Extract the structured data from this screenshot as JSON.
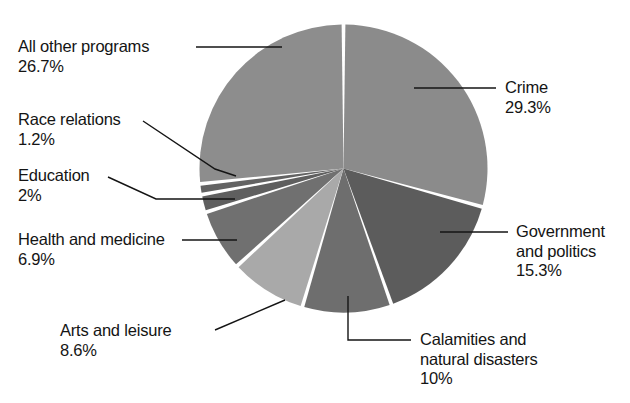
{
  "chart_data": {
    "type": "pie",
    "title": "",
    "subtitle": "",
    "xlabel": "",
    "ylabel": "",
    "grid": false,
    "legend_position": "none",
    "start_angle_deg": 0,
    "direction": "clockwise",
    "separator_color": "#ffffff",
    "background": "#ffffff",
    "text_color": "#141414",
    "categories": [
      "Crime",
      "Government and politics",
      "Calamities and natural disasters",
      "Arts and leisure",
      "Health and medicine",
      "Education",
      "Race relations",
      "All other programs"
    ],
    "values": [
      29.3,
      15.3,
      10,
      8.6,
      6.9,
      2,
      1.2,
      26.7
    ],
    "value_labels": [
      "29.3%",
      "15.3%",
      "10%",
      "8.6%",
      "6.9%",
      "2%",
      "1.2%",
      "26.7%"
    ],
    "colors": [
      "#8b8b8b",
      "#5c5c5c",
      "#6e6e6e",
      "#a9a9a9",
      "#707070",
      "#5f5f5f",
      "#636363",
      "#8d8d8d"
    ],
    "slices": [
      {
        "name": "Crime",
        "label_line1": "Crime",
        "label_line2": "",
        "percent_label": "29.3%",
        "value": 29.3,
        "color": "#8b8b8b"
      },
      {
        "name": "Government and politics",
        "label_line1": "Government",
        "label_line2": "and politics",
        "percent_label": "15.3%",
        "value": 15.3,
        "color": "#5c5c5c"
      },
      {
        "name": "Calamities and natural disasters",
        "label_line1": "Calamities and",
        "label_line2": "natural disasters",
        "percent_label": "10%",
        "value": 10,
        "color": "#6e6e6e"
      },
      {
        "name": "Arts and leisure",
        "label_line1": "Arts and leisure",
        "label_line2": "",
        "percent_label": "8.6%",
        "value": 8.6,
        "color": "#a9a9a9"
      },
      {
        "name": "Health and medicine",
        "label_line1": "Health and medicine",
        "label_line2": "",
        "percent_label": "6.9%",
        "value": 6.9,
        "color": "#707070"
      },
      {
        "name": "Education",
        "label_line1": "Education",
        "label_line2": "",
        "percent_label": "2%",
        "value": 2,
        "color": "#5f5f5f"
      },
      {
        "name": "Race relations",
        "label_line1": "Race relations",
        "label_line2": "",
        "percent_label": "1.2%",
        "value": 1.2,
        "color": "#636363"
      },
      {
        "name": "All other programs",
        "label_line1": "All other programs",
        "label_line2": "",
        "percent_label": "26.7%",
        "value": 26.7,
        "color": "#8d8d8d"
      }
    ]
  }
}
